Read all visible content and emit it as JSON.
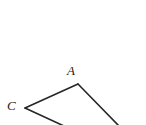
{
  "figure": {
    "type": "geometry-line-diagram",
    "canvas": {
      "width": 146,
      "height": 125,
      "background": "#ffffff"
    },
    "stroke": {
      "color": "#262626",
      "width": 1.6,
      "linecap": "round",
      "linejoin": "round"
    },
    "vertices": [
      {
        "id": "A",
        "label": "A",
        "x": 78,
        "y": 84,
        "label_x": 67,
        "label_y": 64
      },
      {
        "id": "C",
        "label": "C",
        "x": 25,
        "y": 108,
        "label_x": 7,
        "label_y": 99
      }
    ],
    "segments": [
      {
        "id": "segment-c-a",
        "from": "C",
        "to": "A",
        "x1": 25,
        "y1": 108,
        "x2": 78,
        "y2": 84
      },
      {
        "id": "segment-a-down-right",
        "from": "A",
        "to": "edge-bottom-right",
        "x1": 78,
        "y1": 84,
        "x2": 119,
        "y2": 126
      },
      {
        "id": "segment-c-down-right",
        "from": "C",
        "to": "edge-bottom",
        "x1": 25,
        "y1": 108,
        "x2": 64,
        "y2": 126
      }
    ],
    "labels": {
      "a": "A",
      "c": "C"
    }
  }
}
